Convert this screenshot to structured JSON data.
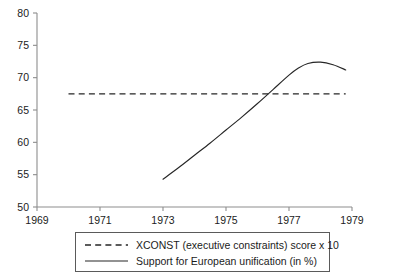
{
  "chart_data": {
    "type": "line",
    "title": "",
    "xlabel": "",
    "ylabel": "",
    "xlim": [
      1969,
      1979
    ],
    "ylim": [
      50,
      80
    ],
    "xticks": [
      1969,
      1971,
      1973,
      1975,
      1977,
      1979
    ],
    "xtick_labels": [
      "1969",
      "1971",
      "1973",
      "1975",
      "1977",
      "1979"
    ],
    "yticks": [
      50,
      55,
      60,
      65,
      70,
      75,
      80
    ],
    "ytick_labels": [
      "50",
      "55",
      "60",
      "65",
      "70",
      "75",
      "80"
    ],
    "grid": false,
    "legend_position": "below-center",
    "series": [
      {
        "name": "XCONST (executive constraints) score x 10",
        "style": "dashed",
        "color": "#262626",
        "x": [
          1970.0,
          1971.0,
          1972.0,
          1973.0,
          1974.0,
          1975.0,
          1976.0,
          1977.0,
          1978.0,
          1978.8
        ],
        "values": [
          67.5,
          67.5,
          67.5,
          67.5,
          67.5,
          67.5,
          67.5,
          67.5,
          67.5,
          67.5
        ]
      },
      {
        "name": "Support for European unification (in %)",
        "style": "solid",
        "color": "#262626",
        "x": [
          1973.0,
          1973.5,
          1974.0,
          1974.5,
          1975.0,
          1975.5,
          1976.0,
          1976.5,
          1977.0,
          1977.3,
          1977.6,
          1978.0,
          1978.4,
          1978.8
        ],
        "values": [
          54.3,
          56.1,
          58.0,
          59.9,
          61.9,
          63.9,
          66.0,
          68.2,
          70.4,
          71.5,
          72.2,
          72.4,
          72.0,
          71.2
        ]
      }
    ]
  },
  "legend": {
    "entries": [
      {
        "label": "XCONST (executive constraints) score x 10",
        "style": "dashed"
      },
      {
        "label": "Support for European unification (in %)",
        "style": "solid"
      }
    ]
  }
}
